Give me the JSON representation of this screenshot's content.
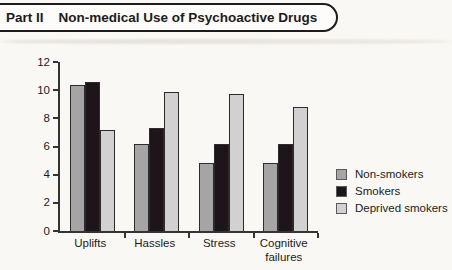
{
  "header": {
    "part_label": "Part II",
    "title": "Non-medical Use of Psychoactive Drugs"
  },
  "colors": {
    "non_smokers": "#a7a4a6",
    "smokers": "#1d1519",
    "deprived_smokers": "#d3d0d1",
    "bar_outline": "#2c2c2c",
    "axis": "#343434",
    "page_bg": "#faf8f4",
    "header_border": "#1c1c1c",
    "text": "#1b1b1b"
  },
  "chart_data": {
    "type": "bar",
    "title": "Part II  Non-medical Use of Psychoactive Drugs",
    "categories": [
      "Uplifts",
      "Hassles",
      "Stress",
      "Cognitive failures"
    ],
    "series": [
      {
        "name": "Non-smokers",
        "color_key": "non_smokers",
        "values": [
          10.4,
          6.2,
          4.8,
          4.8
        ]
      },
      {
        "name": "Smokers",
        "color_key": "smokers",
        "values": [
          10.6,
          7.3,
          6.2,
          6.2
        ]
      },
      {
        "name": "Deprived smokers",
        "color_key": "deprived_smokers",
        "values": [
          7.2,
          9.9,
          9.7,
          8.8
        ]
      }
    ],
    "xlabel": "",
    "ylabel": "",
    "ylim": [
      0,
      12
    ],
    "yticks": [
      0,
      2,
      4,
      6,
      8,
      10,
      12
    ],
    "grid": false,
    "legend_position": "right"
  }
}
